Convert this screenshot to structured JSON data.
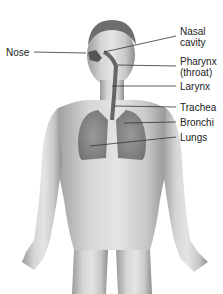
{
  "diagram": {
    "labels": [
      {
        "id": "nose",
        "text": "Nose"
      },
      {
        "id": "nasal-cavity",
        "line1": "Nasal",
        "line2": "cavity"
      },
      {
        "id": "pharynx",
        "line1": "Pharynx",
        "line2": "(throat)"
      },
      {
        "id": "larynx",
        "text": "Larynx"
      },
      {
        "id": "trachea",
        "text": "Trachea"
      },
      {
        "id": "bronchi",
        "text": "Bronchi"
      },
      {
        "id": "lungs",
        "text": "Lungs"
      }
    ]
  }
}
